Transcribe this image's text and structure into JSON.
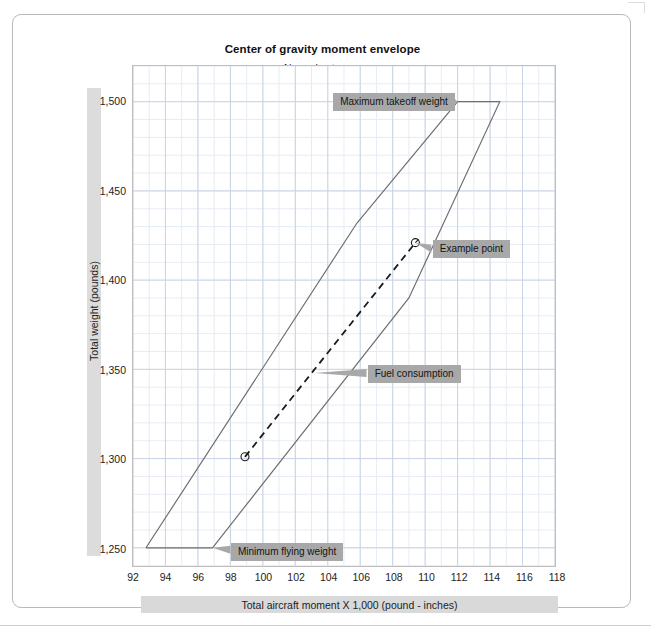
{
  "chart_data": {
    "type": "line",
    "title": "Center of gravity moment envelope",
    "subtitle": "Normal category",
    "xlabel": "Total aircraft moment X 1,000 (pound - inches)",
    "ylabel": "Total weight (pounds)",
    "xlim": [
      92,
      118
    ],
    "ylim": [
      1240,
      1520
    ],
    "xticks": [
      92,
      94,
      96,
      98,
      100,
      102,
      104,
      106,
      108,
      110,
      112,
      114,
      116,
      118
    ],
    "xtick_labels": [
      "92",
      "94",
      "96",
      "98",
      "100",
      "102",
      "104",
      "106",
      "108",
      "110",
      "112",
      "114",
      "116",
      "118"
    ],
    "yticks": [
      1250,
      1300,
      1350,
      1400,
      1450,
      1500
    ],
    "ytick_labels": [
      "1,250",
      "1,300",
      "1,350",
      "1,400",
      "1,450",
      "1,500"
    ],
    "grid": true,
    "grid_minor_x_step": 1,
    "grid_minor_y_step": 10,
    "legend": "none",
    "series": [
      {
        "name": "cg moment envelope",
        "kind": "closed-polygon",
        "style": "solid",
        "color": "#6f6f6f",
        "points": [
          [
            92.8,
            1250
          ],
          [
            96.9,
            1250
          ],
          [
            109.0,
            1390
          ],
          [
            114.6,
            1500
          ],
          [
            112.0,
            1500
          ],
          [
            105.8,
            1432
          ],
          [
            92.8,
            1250
          ]
        ]
      },
      {
        "name": "Fuel consumption",
        "kind": "line-with-endpoint-markers",
        "style": "dashed",
        "color": "#1a1a1a",
        "points": [
          [
            98.9,
            1301
          ],
          [
            109.4,
            1421
          ]
        ]
      }
    ],
    "markers": [
      {
        "name": "example-point",
        "x": 109.4,
        "y": 1421,
        "shape": "circle-open"
      },
      {
        "name": "zero-fuel-point",
        "x": 98.9,
        "y": 1301,
        "shape": "circle-open"
      }
    ],
    "annotations": [
      {
        "name": "maximum-takeoff-weight",
        "label": "Maximum takeoff weight",
        "target": [
          112.0,
          1500
        ],
        "side": "left"
      },
      {
        "name": "example-point",
        "label": "Example point",
        "target": [
          109.4,
          1421
        ],
        "side": "right"
      },
      {
        "name": "fuel-consumption",
        "label": "Fuel consumption",
        "target": [
          103.2,
          1348
        ],
        "side": "right"
      },
      {
        "name": "minimum-flying-weight",
        "label": "Minimum flying weight",
        "target": [
          96.9,
          1250
        ],
        "side": "right"
      }
    ]
  },
  "colors": {
    "band": "#dcdcdc",
    "chip": "#a8a8a8",
    "envelope": "#6f6f6f",
    "grid_major": "#c9d4e4",
    "grid_minor": "#e6ecf4",
    "frame": "#b9b9b9"
  }
}
